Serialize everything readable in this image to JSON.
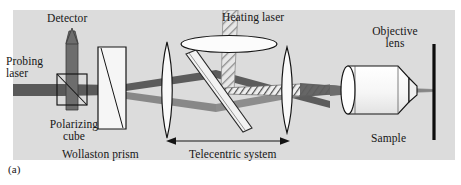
{
  "figure": {
    "panel_label": "(a)",
    "caption_position": "bottom-left",
    "background_color": "#ffffff",
    "panel_color": "#dcdcdc"
  },
  "labels": {
    "detector": "Detector",
    "probing_laser": "Probing\nlaser",
    "probing_laser_line1": "Probing",
    "probing_laser_line2": "laser",
    "heating_laser": "Heating laser",
    "polarizing_cube": "Polarizing\ncube",
    "polarizing_cube_line1": "Polarizing",
    "polarizing_cube_line2": "cube",
    "wollaston_prism": "Wollaston prism",
    "telecentric_system": "Telecentric system",
    "objective_lens": "Objective\nlens",
    "objective_lens_line1": "Objective",
    "objective_lens_line2": "lens",
    "sample": "Sample"
  },
  "colors": {
    "panel_bg": "#dcdcdc",
    "beam_dark": "#4a4a4a",
    "beam_mid": "#6e6e6e",
    "beam_light": "#9a9a9a",
    "detector_fill": "#6a6a6a",
    "optic_fill": "#f4f4f4",
    "outline": "#1a1a1a",
    "sample_line": "#0d0d0d",
    "hatch": "#8f8f8f",
    "text": "#161616"
  },
  "components": [
    {
      "name": "detector",
      "type": "detector",
      "x": 70,
      "y": 28,
      "label": "Detector"
    },
    {
      "name": "probing-laser-source",
      "type": "beam-source",
      "x": 12,
      "y": 88,
      "label": "Probing laser"
    },
    {
      "name": "polarizing-cube",
      "type": "beamsplitter-cube",
      "x": 62,
      "y": 88,
      "label": "Polarizing cube"
    },
    {
      "name": "wollaston-prism",
      "type": "prism",
      "x": 110,
      "y": 88,
      "label": "Wollaston prism"
    },
    {
      "name": "telecentric-lens-1",
      "type": "lens",
      "x": 167,
      "y": 88,
      "label": "Telecentric lens 1"
    },
    {
      "name": "dichroic-mirror",
      "type": "tilted-mirror",
      "x": 215,
      "y": 88,
      "label": "Dichroic mirror"
    },
    {
      "name": "heating-laser-lens",
      "type": "lens-face-on",
      "x": 230,
      "y": 46,
      "label": "Heating laser lens"
    },
    {
      "name": "heating-laser-beam",
      "type": "beam-hatched",
      "x": 230,
      "y": 20,
      "label": "Heating laser"
    },
    {
      "name": "telecentric-lens-2",
      "type": "lens",
      "x": 286,
      "y": 88,
      "label": "Telecentric lens 2"
    },
    {
      "name": "objective-lens",
      "type": "objective-barrel",
      "x": 388,
      "y": 90,
      "label": "Objective lens"
    },
    {
      "name": "sample",
      "type": "sample-plane",
      "x": 434,
      "y": 90,
      "label": "Sample"
    }
  ],
  "annotations": {
    "telecentric_span": {
      "label": "Telecentric system",
      "x_start": 168,
      "x_end": 288,
      "y": 140,
      "arrow": "double"
    }
  }
}
